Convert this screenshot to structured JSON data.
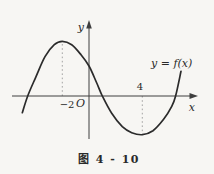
{
  "figure": {
    "caption": "图 4 - 10",
    "function_label": "y = f(x)",
    "axis": {
      "x_label": "x",
      "y_label": "y",
      "origin_label": "O"
    },
    "tick_labels": {
      "x_neg2": "−2",
      "x_4": "4"
    }
  },
  "colors": {
    "background": "#f7f6f3",
    "curve": "#2b2b2b",
    "axis": "#3e3e3e",
    "dashed_guide": "#9b9b9b",
    "text": "#2a2a2a"
  },
  "chart_data": {
    "type": "line",
    "title": "图 4 - 10",
    "xlabel": "x",
    "ylabel": "y",
    "legend": [],
    "annotations": [
      "y = f(x)"
    ],
    "grid": false,
    "xlim": [
      -5.8,
      8.1
    ],
    "ylim": [
      -3.4,
      5.6
    ],
    "x_ticks_labeled": [
      -2,
      4
    ],
    "local_maximum": {
      "x": -2,
      "y": 4.1
    },
    "local_minimum": {
      "x": 4,
      "y": -2.9
    },
    "y_intercept_approx": 2.25,
    "x_intercepts_approx": [
      -4.6,
      1.0,
      6.5
    ],
    "guide_lines": [
      {
        "x": -2,
        "from_y": 0,
        "to_y": 4.05,
        "style": "dotted"
      },
      {
        "x": 4,
        "from_y": 0,
        "to_y": -2.88,
        "style": "dotted"
      }
    ],
    "curve": {
      "name": "y = f(x)",
      "points": [
        [
          -5.0,
          -1.25
        ],
        [
          -4.6,
          0.0
        ],
        [
          -4.0,
          1.4
        ],
        [
          -3.3,
          2.95
        ],
        [
          -2.6,
          3.85
        ],
        [
          -2.0,
          4.1
        ],
        [
          -1.3,
          3.85
        ],
        [
          -0.6,
          3.1
        ],
        [
          0.0,
          2.25
        ],
        [
          0.55,
          1.05
        ],
        [
          1.0,
          0.0
        ],
        [
          1.7,
          -1.3
        ],
        [
          2.5,
          -2.3
        ],
        [
          3.2,
          -2.75
        ],
        [
          4.0,
          -2.9
        ],
        [
          4.8,
          -2.6
        ],
        [
          5.6,
          -1.75
        ],
        [
          6.2,
          -0.8
        ],
        [
          6.5,
          0.0
        ],
        [
          6.9,
          1.85
        ]
      ]
    }
  }
}
